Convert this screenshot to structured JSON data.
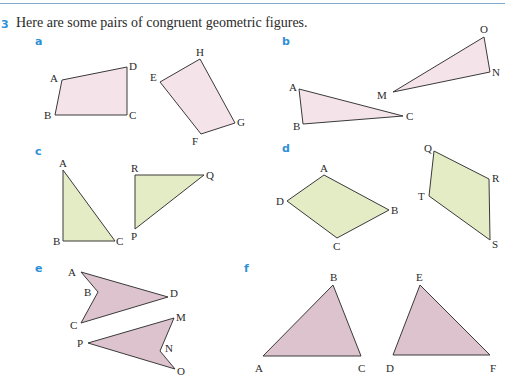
{
  "question": {
    "number": "3",
    "text": "Here are some pairs of congruent geometric figures."
  },
  "colors": {
    "accent": "#2e8fd6",
    "pink_fill": "#f5e3ea",
    "green_fill": "#e4ecc6",
    "mauve_fill": "#ddc3cd",
    "stroke": "#3a3a3a"
  },
  "parts": [
    {
      "label": "a",
      "fill": "pink",
      "figures": [
        {
          "name": "ABCD",
          "vertices": {
            "A": [
              62,
              80
            ],
            "B": [
              55,
              115
            ],
            "C": [
              127,
              115
            ],
            "D": [
              127,
              67
            ]
          }
        },
        {
          "name": "EFGH",
          "vertices": {
            "E": [
              160,
              82
            ],
            "F": [
              201,
              134
            ],
            "G": [
              235,
              123
            ],
            "H": [
              200,
              59
            ]
          }
        }
      ]
    },
    {
      "label": "b",
      "fill": "pink",
      "figures": [
        {
          "name": "ABC",
          "vertices": {
            "A": [
              299,
              89
            ],
            "B": [
              303,
              124
            ],
            "C": [
              403,
              116
            ]
          }
        },
        {
          "name": "MNO",
          "vertices": {
            "M": [
              393,
              92
            ],
            "N": [
              490,
              72
            ],
            "O": [
              484,
              37
            ]
          }
        }
      ]
    },
    {
      "label": "c",
      "fill": "green",
      "figures": [
        {
          "name": "ABC",
          "vertices": {
            "A": [
              63,
              170
            ],
            "B": [
              63,
              241
            ],
            "C": [
              115,
              241
            ]
          }
        },
        {
          "name": "PQR",
          "vertices": {
            "P": [
              135,
              229
            ],
            "Q": [
              204,
              175
            ],
            "R": [
              135,
              175
            ]
          }
        }
      ]
    },
    {
      "label": "d",
      "fill": "green",
      "figures": [
        {
          "name": "ABCD",
          "vertices": {
            "A": [
              324,
              175
            ],
            "B": [
              389,
              210
            ],
            "C": [
              337,
              238
            ],
            "D": [
              287,
              201
            ]
          }
        },
        {
          "name": "QRST",
          "vertices": {
            "Q": [
              434,
              151
            ],
            "R": [
              489,
              179
            ],
            "S": [
              490,
              240
            ],
            "T": [
              429,
              196
            ]
          }
        }
      ]
    },
    {
      "label": "e",
      "fill": "mauve",
      "figures": [
        {
          "name": "ABCD",
          "vertices": {
            "A": [
              81,
              272
            ],
            "B": [
              98,
              292
            ],
            "C": [
              81,
              323
            ],
            "D": [
              168,
              297
            ]
          }
        },
        {
          "name": "MNOP",
          "vertices": {
            "M": [
              174,
              318
            ],
            "N": [
              160,
              351
            ],
            "O": [
              175,
              369
            ],
            "P": [
              88,
              343
            ]
          }
        }
      ]
    },
    {
      "label": "f",
      "fill": "mauve",
      "figures": [
        {
          "name": "ABC",
          "vertices": {
            "A": [
              263,
              356
            ],
            "B": [
              333,
              285
            ],
            "C": [
              361,
              356
            ]
          }
        },
        {
          "name": "DEF",
          "vertices": {
            "D": [
              393,
              355
            ],
            "E": [
              420,
              285
            ],
            "F": [
              490,
              355
            ]
          }
        }
      ]
    }
  ]
}
